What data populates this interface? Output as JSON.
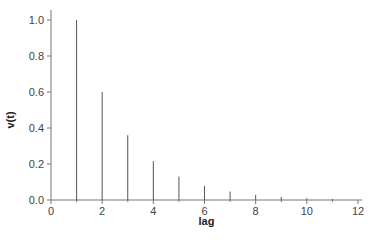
{
  "chart_data": {
    "type": "bar",
    "style": "stem",
    "title": "",
    "xlabel": "lag",
    "ylabel": "v(t)",
    "xlim": [
      0,
      12
    ],
    "ylim": [
      0,
      1.0
    ],
    "x_ticks": [
      0,
      2,
      4,
      6,
      8,
      10,
      12
    ],
    "x_tick_labels": [
      "0",
      "2",
      "4",
      "6",
      "8",
      "10",
      "12"
    ],
    "y_ticks": [
      0.0,
      0.2,
      0.4,
      0.6,
      0.8,
      1.0
    ],
    "y_tick_labels": [
      "0.0",
      "0.2",
      "0.4",
      "0.6",
      "0.8",
      "1.0"
    ],
    "grid": false,
    "legend": null,
    "x": [
      1,
      2,
      3,
      4,
      5,
      6,
      7,
      8,
      9,
      10,
      11
    ],
    "values": [
      1.0,
      0.6,
      0.36,
      0.216,
      0.13,
      0.078,
      0.047,
      0.028,
      0.017,
      0.01,
      0.006
    ],
    "color": "#555555"
  }
}
